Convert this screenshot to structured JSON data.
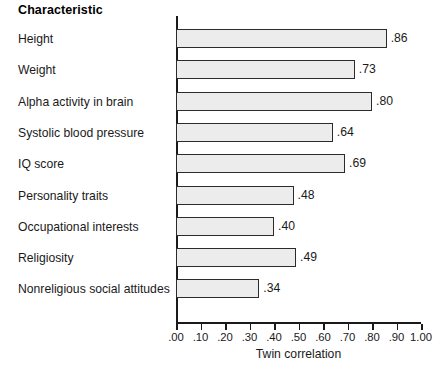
{
  "header": {
    "column_title": "Characteristic"
  },
  "chart_data": {
    "type": "bar",
    "orientation": "horizontal",
    "title": "",
    "xlabel": "Twin correlation",
    "ylabel": "Characteristic",
    "xlim": [
      0.0,
      1.0
    ],
    "grid": false,
    "legend": "none",
    "categories": [
      "Height",
      "Weight",
      "Alpha activity in brain",
      "Systolic blood pressure",
      "IQ score",
      "Personality traits",
      "Occupational interests",
      "Religiosity",
      "Nonreligious social attitudes"
    ],
    "values": [
      0.86,
      0.73,
      0.8,
      0.64,
      0.69,
      0.48,
      0.4,
      0.49,
      0.34
    ],
    "value_labels": [
      ".86",
      ".73",
      ".80",
      ".64",
      ".69",
      ".48",
      ".40",
      ".49",
      ".34"
    ],
    "xticks": [
      0.0,
      0.1,
      0.2,
      0.3,
      0.4,
      0.5,
      0.6,
      0.7,
      0.8,
      0.9,
      1.0
    ],
    "xtick_labels": [
      ".00",
      ".10",
      ".20",
      ".30",
      ".40",
      ".50",
      ".60",
      ".70",
      ".80",
      ".90",
      "1.00"
    ],
    "bar_fill": "#ececec",
    "bar_stroke": "#2b2b2b",
    "axis_color": "#1a1a1a"
  }
}
